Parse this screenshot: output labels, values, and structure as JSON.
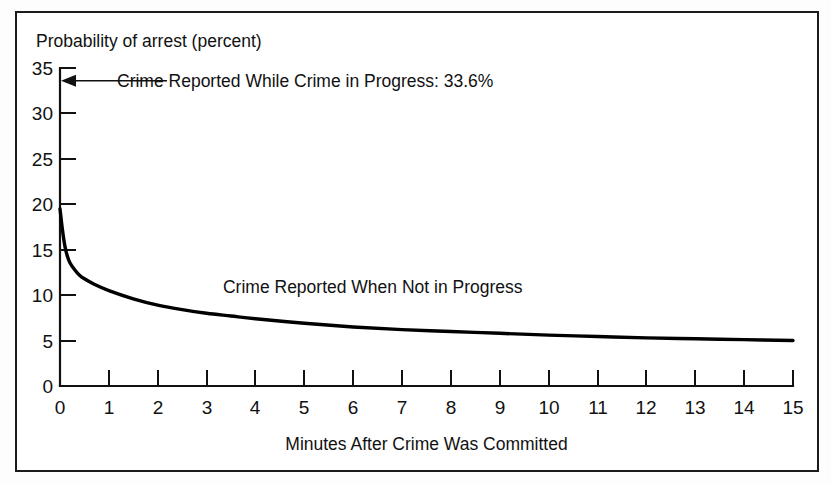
{
  "figure": {
    "y_axis_title": "Probability of arrest (percent)",
    "x_axis_title": "Minutes After Crime Was Committed",
    "in_progress_annotation": "Crime Reported While Crime in Progress:  33.6%",
    "not_in_progress_label": "Crime Reported When Not in Progress",
    "frame_color": "#1b1b1b",
    "curve_color": "#000000",
    "background_color": "#ffffff"
  },
  "chart_data": {
    "type": "line",
    "title": "",
    "xlabel": "Minutes After Crime Was Committed",
    "ylabel": "Probability of arrest (percent)",
    "xlim": [
      0,
      15
    ],
    "ylim": [
      0,
      35
    ],
    "xticks": [
      0,
      1,
      2,
      3,
      4,
      5,
      6,
      7,
      8,
      9,
      10,
      11,
      12,
      13,
      14,
      15
    ],
    "yticks": [
      0,
      5,
      10,
      15,
      20,
      25,
      30,
      35
    ],
    "grid": false,
    "legend": "in-plot labels",
    "series": [
      {
        "name": "Crime Reported When Not in Progress",
        "x": [
          0,
          0.05,
          0.1,
          0.15,
          0.2,
          0.3,
          0.4,
          0.5,
          0.7,
          1,
          1.5,
          2,
          2.5,
          3,
          3.5,
          4,
          5,
          6,
          7,
          8,
          9,
          10,
          11,
          12,
          13,
          14,
          15
        ],
        "values": [
          19.5,
          17.2,
          15.4,
          14.3,
          13.6,
          12.8,
          12.2,
          11.8,
          11.2,
          10.5,
          9.6,
          8.9,
          8.4,
          8.0,
          7.7,
          7.4,
          6.9,
          6.5,
          6.2,
          6.0,
          5.8,
          5.6,
          5.45,
          5.3,
          5.2,
          5.1,
          5.0
        ]
      }
    ],
    "annotations": [
      {
        "text": "Crime Reported While Crime in Progress:  33.6%",
        "value": 33.6,
        "x": 0,
        "y": 33.6,
        "style": "arrow pointing left to y-axis"
      },
      {
        "text": "Crime Reported When Not in Progress",
        "x": 6.4,
        "y": 10.2,
        "style": "plain text above curve"
      }
    ]
  }
}
